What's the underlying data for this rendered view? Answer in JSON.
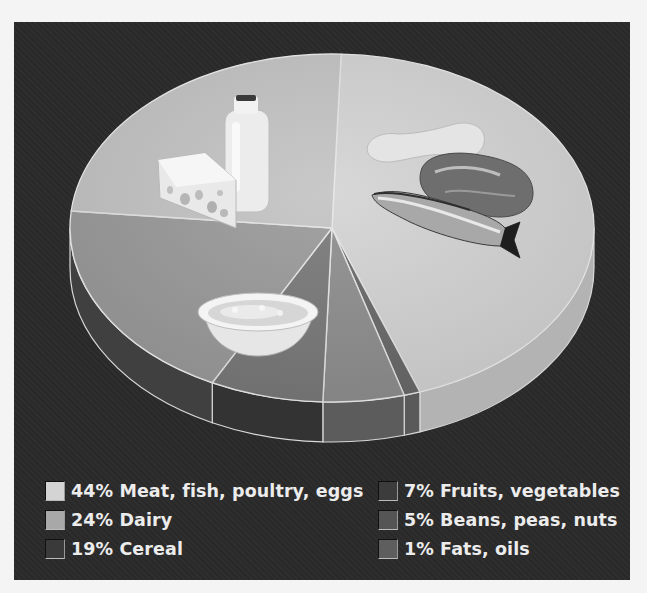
{
  "chart_data": {
    "type": "pie",
    "style": "3d",
    "title": "",
    "slices": [
      {
        "label": "Meat, fish, poultry, eggs",
        "value": 44,
        "color": "#d4d4d4",
        "side": "#b3b3b3",
        "image": "chicken-steak-fish"
      },
      {
        "label": "Fats, oils",
        "value": 1,
        "color": "#6a6a6a",
        "side": "#5a5a5a",
        "image": ""
      },
      {
        "label": "Beans, peas, nuts",
        "value": 5,
        "color": "#8f8f8f",
        "side": "#5c5c5c",
        "image": ""
      },
      {
        "label": "Fruits, vegetables",
        "value": 7,
        "color": "#7a7a7a",
        "side": "#333333",
        "image": ""
      },
      {
        "label": "Cereal",
        "value": 19,
        "color": "#9b9b9b",
        "side": "#404040",
        "image": "cereal-bowl"
      },
      {
        "label": "Dairy",
        "value": 24,
        "color": "#c4c4c4",
        "side": "#9e9e9e",
        "image": "milk-cheese"
      }
    ],
    "legend_position": "bottom",
    "legend_columns": 2
  },
  "legend": {
    "items": [
      {
        "text": "44% Meat, fish, poultry, eggs",
        "color": "#d4d4d4",
        "col": 0,
        "row": 0
      },
      {
        "text": "24% Dairy",
        "color": "#a8a8a8",
        "col": 0,
        "row": 1
      },
      {
        "text": "19% Cereal",
        "color": "#3a3a3a",
        "col": 0,
        "row": 2
      },
      {
        "text": "7% Fruits, vegetables",
        "color": "#3c3c3c",
        "col": 1,
        "row": 0
      },
      {
        "text": "5% Beans, peas, nuts",
        "color": "#555555",
        "col": 1,
        "row": 1
      },
      {
        "text": "1% Fats, oils",
        "color": "#5e5e5e",
        "col": 1,
        "row": 2
      }
    ]
  },
  "colors": {
    "background": "#2a2a2a",
    "page": "#f4f4f4",
    "text": "#ececec"
  }
}
